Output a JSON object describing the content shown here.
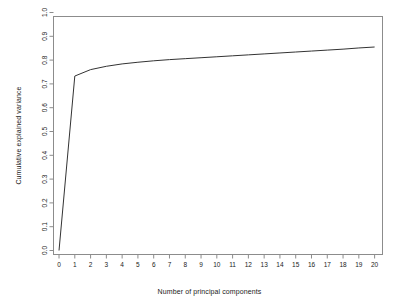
{
  "chart_data": {
    "type": "line",
    "title": "",
    "xlabel": "Number of principal components",
    "ylabel": "Cumulative explained variance",
    "xlim": [
      -0.35,
      20.5
    ],
    "ylim": [
      0.0,
      1.0
    ],
    "grid": false,
    "legend": null,
    "x_ticks": [
      "0",
      "1",
      "2",
      "3",
      "4",
      "5",
      "6",
      "7",
      "8",
      "9",
      "10",
      "11",
      "12",
      "13",
      "14",
      "15",
      "16",
      "17",
      "18",
      "19",
      "20"
    ],
    "y_ticks": [
      "0.0",
      "0.1",
      "0.2",
      "0.3",
      "0.4",
      "0.5",
      "0.6",
      "0.7",
      "0.8",
      "0.9",
      "1.0"
    ],
    "line_color": "#333333",
    "line_width": 1,
    "series": [
      {
        "name": "Cumulative explained variance",
        "x": [
          0,
          1,
          2,
          3,
          4,
          5,
          6,
          7,
          8,
          9,
          10,
          11,
          12,
          13,
          14,
          15,
          16,
          17,
          18,
          19,
          20
        ],
        "values": [
          0.0,
          0.733,
          0.76,
          0.774,
          0.784,
          0.791,
          0.797,
          0.802,
          0.806,
          0.81,
          0.814,
          0.818,
          0.822,
          0.826,
          0.83,
          0.834,
          0.838,
          0.842,
          0.846,
          0.851,
          0.855
        ]
      }
    ]
  },
  "axis": {
    "x_title": "Number of principal components",
    "y_title": "Cumulative explained variance"
  },
  "style": {
    "background": "#ffffff",
    "frame_color": "#8c8c8c",
    "tick_color": "#8c8c8c",
    "text_color": "#1a1a1a"
  }
}
